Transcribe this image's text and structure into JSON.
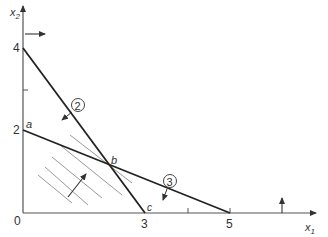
{
  "diagram": {
    "type": "linear-programming-feasible-region",
    "axes": {
      "x": {
        "label": "x",
        "subscript": "1",
        "ticks": [
          {
            "value": 3,
            "label": "3"
          },
          {
            "value": 4,
            "label": ""
          },
          {
            "value": 5,
            "label": "5"
          }
        ]
      },
      "y": {
        "label": "x",
        "subscript": "2",
        "ticks": [
          {
            "value": 2,
            "label": "2"
          },
          {
            "value": 3,
            "label": ""
          },
          {
            "value": 4,
            "label": "4"
          }
        ]
      },
      "origin_label": "0"
    },
    "constraints": [
      {
        "id": "2",
        "label": "2",
        "from": [
          0,
          4
        ],
        "to": [
          3,
          0
        ]
      },
      {
        "id": "3",
        "label": "3",
        "from": [
          0,
          2
        ],
        "to": [
          5,
          0
        ]
      }
    ],
    "points": [
      {
        "name": "a",
        "label": "a"
      },
      {
        "name": "b",
        "label": "b"
      },
      {
        "name": "c",
        "label": "c"
      }
    ],
    "feasible_region": "hatched"
  }
}
